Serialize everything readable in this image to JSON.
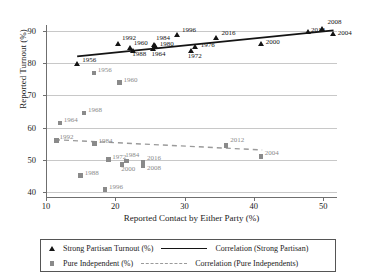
{
  "chart_data": {
    "type": "scatter",
    "title": "",
    "xlabel": "Reported Contact by Either Party (%)",
    "ylabel": "Reported Turnout (%)",
    "xlim": [
      10,
      52
    ],
    "ylim": [
      38,
      92
    ],
    "xticks": [
      10,
      20,
      30,
      40,
      50
    ],
    "yticks": [
      40,
      50,
      60,
      70,
      80,
      90
    ],
    "grid": "horizontal",
    "legend_position": "bottom",
    "series": [
      {
        "name": "Strong Partisan Turnout (%)",
        "marker": "triangle",
        "color": "#141414",
        "points": [
          {
            "label": "1956",
            "x": 14.5,
            "y": 80.0
          },
          {
            "label": "1992",
            "x": 20.4,
            "y": 86.1
          },
          {
            "label": "1960",
            "x": 22.1,
            "y": 85.0
          },
          {
            "label": "1988",
            "x": 22.6,
            "y": 84.1
          },
          {
            "label": "1984",
            "x": 25.6,
            "y": 85.9
          },
          {
            "label": "1980",
            "x": 25.7,
            "y": 85.4
          },
          {
            "label": "1964",
            "x": 25.5,
            "y": 84.6
          },
          {
            "label": "1996",
            "x": 28.9,
            "y": 89.0
          },
          {
            "label": "1972",
            "x": 30.9,
            "y": 83.9
          },
          {
            "label": "1976",
            "x": 31.6,
            "y": 85.1
          },
          {
            "label": "2016",
            "x": 34.6,
            "y": 88.0
          },
          {
            "label": "2000",
            "x": 41.0,
            "y": 86.1
          },
          {
            "label": "2012",
            "x": 47.8,
            "y": 89.8
          },
          {
            "label": "2008",
            "x": 49.9,
            "y": 91.0
          },
          {
            "label": "2004",
            "x": 51.4,
            "y": 89.2
          }
        ]
      },
      {
        "name": "Pure Independent (%)",
        "marker": "square",
        "color": "#8a8a8a",
        "points": [
          {
            "label": "1956",
            "x": 16.9,
            "y": 77.0
          },
          {
            "label": "1960",
            "x": 20.6,
            "y": 74.0
          },
          {
            "label": "1968",
            "x": 15.5,
            "y": 64.5
          },
          {
            "label": "1964",
            "x": 12.0,
            "y": 61.5
          },
          {
            "label": "1992",
            "x": 11.5,
            "y": 56.0
          },
          {
            "label": "1984",
            "x": 17.0,
            "y": 55.0
          },
          {
            "label": "1972",
            "x": 19.0,
            "y": 50.0
          },
          {
            "label": "1984",
            "x": 21.6,
            "y": 49.6
          },
          {
            "label": "2000",
            "x": 21.0,
            "y": 48.4
          },
          {
            "label": "2016",
            "x": 24.0,
            "y": 49.1
          },
          {
            "label": "2008",
            "x": 24.0,
            "y": 48.0
          },
          {
            "label": "1988",
            "x": 15.0,
            "y": 45.0
          },
          {
            "label": "1996",
            "x": 18.5,
            "y": 40.6
          },
          {
            "label": "2012",
            "x": 36.0,
            "y": 54.4
          },
          {
            "label": "2004",
            "x": 41.0,
            "y": 51.0
          }
        ]
      }
    ],
    "trendlines": [
      {
        "name": "Correlation (Strong Partisan)",
        "style": "solid",
        "color": "#141414",
        "x1": 14.5,
        "y1": 82.2,
        "x2": 51.5,
        "y2": 90.3
      },
      {
        "name": "Correlation (Pure Independents)",
        "style": "dashed",
        "color": "#9a9a9a",
        "x1": 11.3,
        "y1": 56.2,
        "x2": 41.2,
        "y2": 53.0
      }
    ]
  },
  "legend": {
    "entries": [
      {
        "label": "Strong Partisan Turnout (%)",
        "key": "triangle-marker"
      },
      {
        "label": "Pure Independent (%)",
        "key": "square-marker"
      }
    ],
    "lines": [
      {
        "label": "Correlation (Strong Partisan)",
        "key": "solid-line-sample"
      },
      {
        "label": "Correlation (Pure Independents)",
        "key": "dashed-line-sample"
      }
    ]
  }
}
